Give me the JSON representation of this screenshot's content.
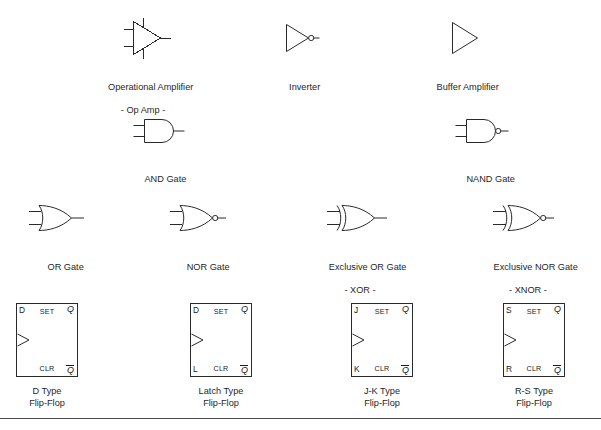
{
  "page": {
    "background_color": "#ffffff",
    "line_color": "#2a2a2a",
    "text_color": "#1f1f1f"
  },
  "rows": {
    "row1": {
      "symbols": [
        {
          "id": "op-amp",
          "shape": "triangle-amplifier-two-inputs",
          "label_line1": "Operational Amplifier",
          "label_line2": "- Op Amp -",
          "has_bubble": false,
          "inputs": 2
        },
        {
          "id": "inverter",
          "shape": "triangle-amplifier",
          "label_line1": "Inverter",
          "label_line2": "",
          "has_bubble": true,
          "inputs": 0
        },
        {
          "id": "buffer",
          "shape": "triangle-amplifier",
          "label_line1": "Buffer Amplifier",
          "label_line2": "",
          "has_bubble": false,
          "inputs": 0
        }
      ]
    },
    "row2": {
      "symbols": [
        {
          "id": "and-gate",
          "shape": "and",
          "label_line1": "AND Gate",
          "label_line2": "",
          "has_bubble": false,
          "inputs": 2
        },
        {
          "id": "nand-gate",
          "shape": "and",
          "label_line1": "NAND Gate",
          "label_line2": "",
          "has_bubble": true,
          "inputs": 2
        }
      ]
    },
    "row3": {
      "symbols": [
        {
          "id": "or-gate",
          "shape": "or",
          "label_line1": "OR Gate",
          "label_line2": "",
          "has_bubble": false,
          "inputs": 2
        },
        {
          "id": "nor-gate",
          "shape": "or",
          "label_line1": "NOR Gate",
          "label_line2": "",
          "has_bubble": true,
          "inputs": 2
        },
        {
          "id": "xor-gate",
          "shape": "xor",
          "label_line1": "Exclusive OR Gate",
          "label_line2": "- XOR -",
          "has_bubble": false,
          "inputs": 2
        },
        {
          "id": "xnor-gate",
          "shape": "xor",
          "label_line1": "Exclusive NOR Gate",
          "label_line2": "- XNOR -",
          "has_bubble": true,
          "inputs": 2
        }
      ]
    },
    "row4": {
      "flipflops": [
        {
          "id": "d-flip-flop",
          "top_left": "D",
          "top_center": "SET",
          "top_right": "Q",
          "bottom_left": "",
          "bottom_center": "CLR",
          "bottom_right": "Q",
          "bottom_right_overbar": true,
          "caption_line1": "D Type",
          "caption_line2": "Flip-Flop"
        },
        {
          "id": "latch-flip-flop",
          "top_left": "D",
          "top_center": "SET",
          "top_right": "Q",
          "bottom_left": "L",
          "bottom_center": "CLR",
          "bottom_right": "Q",
          "bottom_right_overbar": true,
          "caption_line1": "Latch Type",
          "caption_line2": "Flip-Flop"
        },
        {
          "id": "jk-flip-flop",
          "top_left": "J",
          "top_center": "SET",
          "top_right": "Q",
          "bottom_left": "K",
          "bottom_center": "CLR",
          "bottom_right": "Q",
          "bottom_right_overbar": true,
          "caption_line1": "J-K Type",
          "caption_line2": "Flip-Flop"
        },
        {
          "id": "rs-flip-flop",
          "top_left": "S",
          "top_center": "SET",
          "top_right": "Q",
          "bottom_left": "R",
          "bottom_center": "CLR",
          "bottom_right": "Q",
          "bottom_right_overbar": true,
          "caption_line1": "R-S Type",
          "caption_line2": "Flip-Flop"
        }
      ]
    }
  }
}
